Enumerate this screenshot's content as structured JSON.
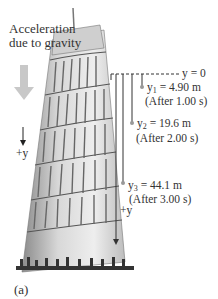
{
  "figure": {
    "label": "(a)",
    "gravity_label": "Acceleration due to gravity",
    "axis_label_left": "+y",
    "axis_label_right": "+y",
    "origin_label": "y = 0",
    "markers": [
      {
        "var": "y",
        "sub": "1",
        "value": "= 4.90 m",
        "time": "(After 1.00 s)"
      },
      {
        "var": "y",
        "sub": "2",
        "value": "= 19.6 m",
        "time": "(After 2.00 s)"
      },
      {
        "var": "y",
        "sub": "3",
        "value": "= 44.1 m",
        "time": "(After 3.00 s)"
      }
    ],
    "colors": {
      "gravity_arrow": "#c8c8c8",
      "lines": "#333333",
      "dots": "#999999"
    }
  }
}
